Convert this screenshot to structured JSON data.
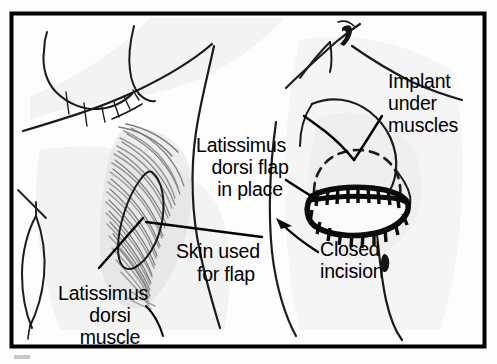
{
  "figure": {
    "frame": {
      "border_color": "#000000",
      "background_color": "#fdfdfd"
    },
    "panels": [
      {
        "name": "donor-site",
        "description": "Back / side view showing latissimus dorsi muscle and skin paddle to be harvested"
      },
      {
        "name": "reconstructed-site",
        "description": "Chest side view showing the flap in place over an implant with a closed incision"
      }
    ]
  },
  "labels": {
    "latissimus_dorsi_muscle": {
      "lines": [
        "Latissimus",
        "dorsi",
        "muscle"
      ],
      "line1": "Latissimus",
      "line2": "dorsi",
      "line3": "muscle"
    },
    "skin_used_for_flap": {
      "lines": [
        "Skin used",
        "for flap"
      ],
      "line1": "Skin used",
      "line2": "for flap"
    },
    "latissimus_dorsi_flap_in_place": {
      "lines": [
        "Latissimus",
        "dorsi flap",
        "in place"
      ],
      "line1": "Latissimus",
      "line2": "dorsi flap",
      "line3": "in place"
    },
    "implant_under_muscles": {
      "lines": [
        "Implant",
        "under",
        "muscles"
      ],
      "line1": "Implant",
      "line2": "under",
      "line3": "muscles"
    },
    "closed_incision": {
      "lines": [
        "Closed",
        "incision"
      ],
      "line1": "Closed",
      "line2": "incision"
    }
  },
  "colors": {
    "ink": "#000000",
    "outline": "#1b1b1b",
    "muscle_fiber": "#9a9a9a",
    "muscle_fiber_dark": "#7e7e7e",
    "shading": "#ececec",
    "paper": "#fdfdfd"
  }
}
